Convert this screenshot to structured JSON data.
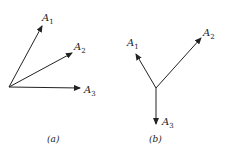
{
  "figure_a": {
    "caption": "(a)",
    "vectors": [
      {
        "name": "A",
        "sub": "1"
      },
      {
        "name": "A",
        "sub": "2"
      },
      {
        "name": "A",
        "sub": "3"
      }
    ]
  },
  "figure_b": {
    "caption": "(b)",
    "vectors": [
      {
        "name": "A",
        "sub": "1"
      },
      {
        "name": "A",
        "sub": "2"
      },
      {
        "name": "A",
        "sub": "3"
      }
    ]
  },
  "colors": {
    "stroke": "#222222",
    "background": "#ffffff"
  }
}
